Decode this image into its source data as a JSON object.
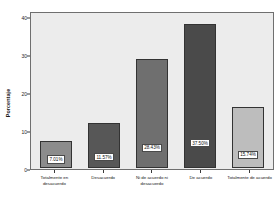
{
  "chart_data": {
    "type": "bar",
    "title": "",
    "subtitle": "",
    "xlabel": "",
    "ylabel": "Porcentaje",
    "categories": [
      "Totalmente en desacuerdo",
      "Desacuerdo",
      "Ni de acuerdo ni desacuerdo",
      "De acuerdo",
      "Totalmente de acuerdo"
    ],
    "values": [
      7.01,
      11.57,
      28.43,
      37.5,
      15.74
    ],
    "data_labels": [
      "7.01%",
      "11.57%",
      "28.43%",
      "37.50%",
      "15.74%"
    ],
    "bar_colors": [
      "#8c8c8c",
      "#575757",
      "#6f6f6f",
      "#4a4a4a",
      "#bdbdbd"
    ],
    "ylim": [
      0,
      40
    ],
    "yticks": [
      0,
      10,
      20,
      30,
      40
    ],
    "ytick_labels": [
      "0",
      "10",
      "20",
      "30",
      "40"
    ],
    "grid": false,
    "legend": false,
    "plot_background": "#ececec",
    "figure_background": "#ffffff",
    "axis_color": "#6f6f6f"
  }
}
